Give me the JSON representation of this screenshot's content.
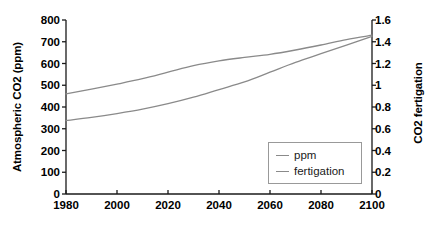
{
  "chart_data": {
    "type": "line",
    "title": "",
    "xlabel": "",
    "ylabel": "Atmospheric CO2 (ppm)",
    "ylabel_right": "CO2 fertigation",
    "xlim": [
      1980,
      2100
    ],
    "ylim": [
      0,
      800
    ],
    "ylim_right": [
      0,
      1.6
    ],
    "grid": false,
    "legend_position": "lower right",
    "xticks": [
      "1980",
      "2000",
      "2020",
      "2040",
      "2060",
      "2080",
      "2100"
    ],
    "xtick_values": [
      1980,
      2000,
      2020,
      2040,
      2060,
      2080,
      2100
    ],
    "yticks_left": [
      "0",
      "100",
      "200",
      "300",
      "400",
      "500",
      "600",
      "700",
      "800"
    ],
    "ytick_values_left": [
      0,
      100,
      200,
      300,
      400,
      500,
      600,
      700,
      800
    ],
    "yticks_right": [
      "0",
      "0.2",
      "0.4",
      "0.6",
      "0.8",
      "1",
      "1.2",
      "1.4",
      "1.6"
    ],
    "ytick_values_right": [
      0,
      0.2,
      0.4,
      0.6,
      0.8,
      1.0,
      1.2,
      1.4,
      1.6
    ],
    "line_color": "#8a8a8a",
    "axis_color": "#1a1a1a",
    "x": [
      1980,
      1990,
      2000,
      2010,
      2020,
      2030,
      2040,
      2050,
      2060,
      2070,
      2080,
      2090,
      2100
    ],
    "series": [
      {
        "name": "ppm",
        "axis": "left",
        "units": "ppm",
        "values": [
          460,
          482,
          505,
          530,
          560,
          590,
          612,
          628,
          642,
          662,
          685,
          710,
          730
        ]
      },
      {
        "name": "fertigation",
        "axis": "right",
        "units": "relative",
        "values": [
          0.675,
          0.705,
          0.74,
          0.78,
          0.83,
          0.89,
          0.96,
          1.03,
          1.12,
          1.21,
          1.29,
          1.37,
          1.45
        ]
      }
    ]
  },
  "legend": {
    "entries": [
      {
        "label": "ppm"
      },
      {
        "label": "fertigation"
      }
    ]
  }
}
